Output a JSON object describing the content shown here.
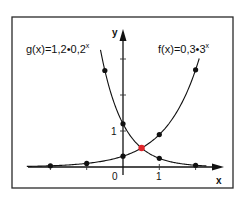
{
  "chart_data": {
    "type": "line",
    "title": "",
    "xlabel": "x",
    "ylabel": "y",
    "xlim": [
      -2.6,
      2.6
    ],
    "ylim": [
      0,
      3.3
    ],
    "grid": false,
    "legend": "inline labels near curves",
    "x_tick_labels": [
      {
        "value": 0,
        "label": "0"
      },
      {
        "value": 1,
        "label": "1"
      }
    ],
    "x_ticks": [
      -2,
      -1,
      0,
      1,
      2
    ],
    "y_tick_labels": [
      {
        "value": 1,
        "label": "1"
      }
    ],
    "y_ticks": [
      1,
      2,
      3
    ],
    "series": [
      {
        "name": "g(x)=1,2·0,2^x",
        "label_base": "g(x)=1,2•0,2",
        "label_exp": "x",
        "formula": {
          "a": 1.2,
          "b": 0.2
        },
        "x_range": [
          -0.62,
          2.3
        ],
        "points": [
          {
            "x": -0.5,
            "y": 2.68
          },
          {
            "x": 0,
            "y": 1.2
          },
          {
            "x": 1,
            "y": 0.24
          },
          {
            "x": 2,
            "y": 0.048
          }
        ],
        "color": "#111111"
      },
      {
        "name": "f(x)=0,3·3^x",
        "label_base": "f(x)=0,3•3",
        "label_exp": "x",
        "formula": {
          "a": 0.3,
          "b": 3
        },
        "x_range": [
          -2.65,
          2.1
        ],
        "points": [
          {
            "x": -2,
            "y": 0.033
          },
          {
            "x": -1,
            "y": 0.1
          },
          {
            "x": 0,
            "y": 0.3
          },
          {
            "x": 1,
            "y": 0.9
          },
          {
            "x": 2,
            "y": 2.7
          }
        ],
        "color": "#111111"
      }
    ],
    "annotations": [
      {
        "type": "intersection",
        "x": 0.512,
        "y": 0.527,
        "color": "#e0262b"
      }
    ]
  },
  "labels": {
    "g": {
      "base": "g(x)=1,2•0,2",
      "exp": "x"
    },
    "f": {
      "base": "f(x)=0,3•3",
      "exp": "x"
    },
    "x_axis": "x",
    "y_axis": "y",
    "origin": "0",
    "x_one": "1",
    "y_one": "1"
  }
}
